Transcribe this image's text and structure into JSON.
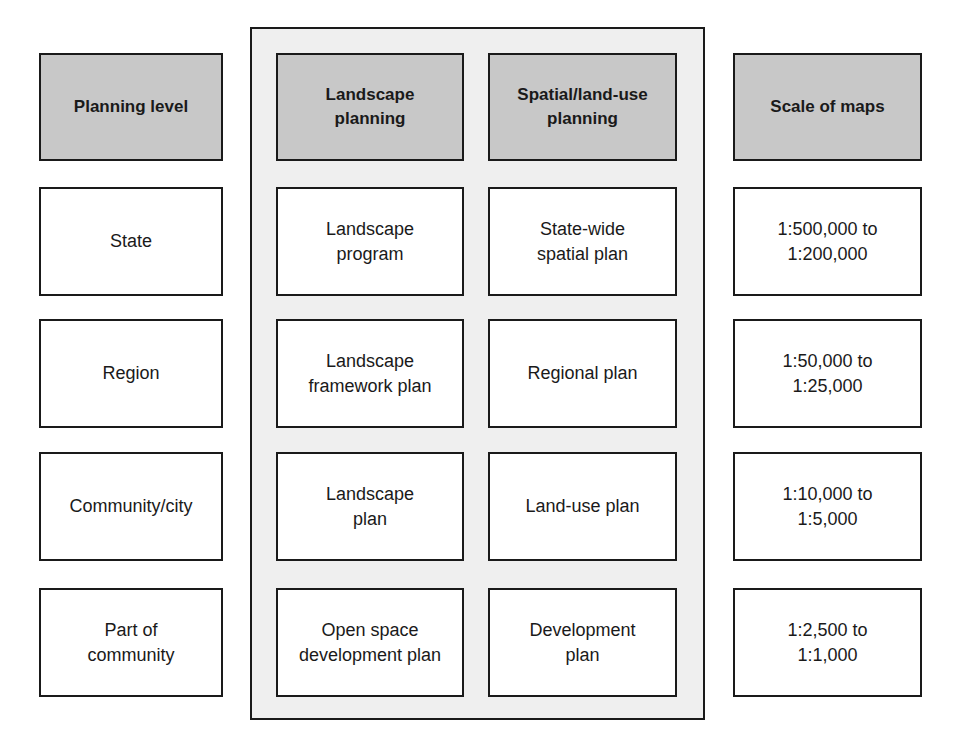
{
  "headers": {
    "planning_level": "Planning level",
    "landscape_planning": "Landscape\nplanning",
    "spatial_planning": "Spatial/land-use\nplanning",
    "scale_of_maps": "Scale of maps"
  },
  "rows": [
    {
      "level": "State",
      "landscape": "Landscape\nprogram",
      "spatial": "State-wide\nspatial plan",
      "scale": "1:500,000 to\n1:200,000"
    },
    {
      "level": "Region",
      "landscape": "Landscape\nframework plan",
      "spatial": "Regional plan",
      "scale": "1:50,000 to\n1:25,000"
    },
    {
      "level": "Community/city",
      "landscape": "Landscape\nplan",
      "spatial": "Land-use plan",
      "scale": "1:10,000 to\n1:5,000"
    },
    {
      "level": "Part of\ncommunity",
      "landscape": "Open space\ndevelopment plan",
      "spatial": "Development\nplan",
      "scale": "1:2,500 to\n1:1,000"
    }
  ],
  "colors": {
    "header_fill": "#c8c8c8",
    "container_fill": "#efefef",
    "box_fill": "#ffffff",
    "border": "#1a1a1a"
  }
}
